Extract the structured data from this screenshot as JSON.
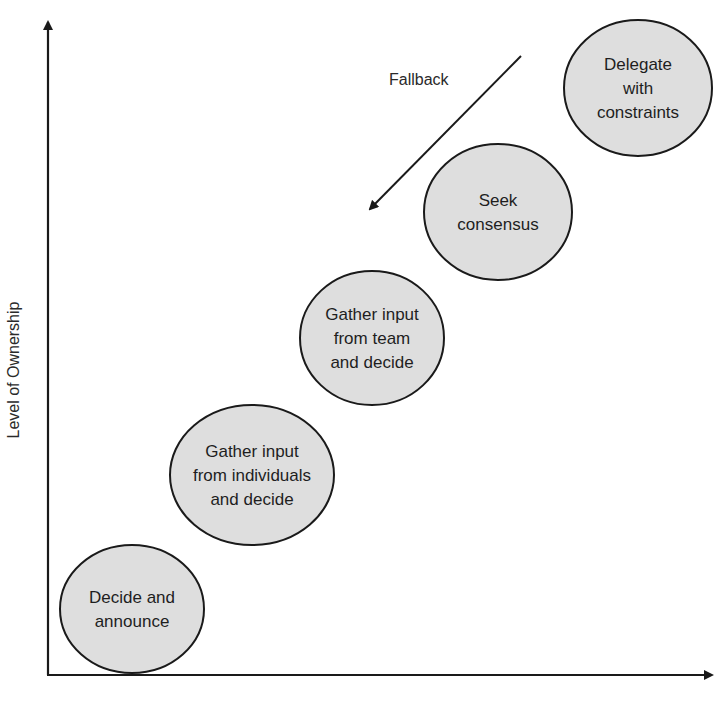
{
  "diagram": {
    "y_axis_label": "Level of Ownership",
    "x_axis_label": "",
    "fallback_label": "Fallback",
    "nodes": [
      {
        "id": "decide-and-announce",
        "lines": [
          "Decide and",
          "announce"
        ]
      },
      {
        "id": "gather-input-individuals",
        "lines": [
          "Gather input",
          "from individuals",
          "and decide"
        ]
      },
      {
        "id": "gather-input-team",
        "lines": [
          "Gather input",
          "from team",
          "and decide"
        ]
      },
      {
        "id": "seek-consensus",
        "lines": [
          "Seek",
          "consensus"
        ]
      },
      {
        "id": "delegate-with-constraints",
        "lines": [
          "Delegate",
          "with",
          "constraints"
        ]
      }
    ]
  },
  "colors": {
    "node_fill": "#dedede",
    "stroke": "#1a1a1a",
    "text": "#1e1e1e"
  }
}
